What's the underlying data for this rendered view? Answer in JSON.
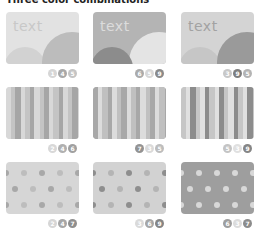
{
  "title": "Three color combinations",
  "cards": [
    {
      "pattern": "circles",
      "text": "text",
      "bg": "#e2e2e2",
      "text_color": "#c8c8c8",
      "circle_big": "#bcbcbc",
      "circle_small": "#d2d2d2",
      "badges": [
        {
          "n": "1",
          "color": "#d6d6d6"
        },
        {
          "n": "4",
          "color": "#a8a8a8"
        },
        {
          "n": "5",
          "color": "#c4c4c4"
        }
      ]
    },
    {
      "pattern": "circles",
      "text": "text",
      "bg": "#b4b4b4",
      "text_color": "#dcdcdc",
      "circle_big": "#e4e4e4",
      "circle_small": "#8c8c8c",
      "badges": [
        {
          "n": "6",
          "color": "#ababab"
        },
        {
          "n": "5",
          "color": "#d8d8d8"
        },
        {
          "n": "9",
          "color": "#8a8a8a"
        }
      ]
    },
    {
      "pattern": "circles",
      "text": "text",
      "bg": "#d4d4d4",
      "text_color": "#a2a2a2",
      "circle_big": "#9a9a9a",
      "circle_small": "#c6c6c6",
      "badges": [
        {
          "n": "3",
          "color": "#c8c8c8"
        },
        {
          "n": "9",
          "color": "#7e7e7e"
        },
        {
          "n": "5",
          "color": "#b4b4b4"
        }
      ]
    },
    {
      "pattern": "stripes",
      "colors": [
        "#d8d8d8",
        "#c4c4c4",
        "#a6a6a6"
      ],
      "badges": [
        {
          "n": "2",
          "color": "#d8d8d8"
        },
        {
          "n": "4",
          "color": "#b0b0b0"
        },
        {
          "n": "6",
          "color": "#a0a0a0"
        }
      ]
    },
    {
      "pattern": "stripes",
      "colors": [
        "#a8a8a8",
        "#dcdcdc",
        "#c0c0c0"
      ],
      "badges": [
        {
          "n": "7",
          "color": "#939393"
        },
        {
          "n": "3",
          "color": "#dadada"
        },
        {
          "n": "5",
          "color": "#bdbdbd"
        }
      ]
    },
    {
      "pattern": "stripes",
      "colors": [
        "#c6c6c6",
        "#e0e0e0",
        "#8c8c8c"
      ],
      "badges": [
        {
          "n": "5",
          "color": "#c4c4c4"
        },
        {
          "n": "3",
          "color": "#e0e0e0"
        },
        {
          "n": "9",
          "color": "#858585"
        }
      ]
    },
    {
      "pattern": "dots",
      "bg": "#d6d6d6",
      "dot_colors": [
        "#a8a8a8",
        "#bdbdbd"
      ],
      "badges": [
        {
          "n": "2",
          "color": "#d6d6d6"
        },
        {
          "n": "4",
          "color": "#a6a6a6"
        },
        {
          "n": "7",
          "color": "#8e8e8e"
        }
      ]
    },
    {
      "pattern": "dots",
      "bg": "#d2d2d2",
      "dot_colors": [
        "#8e8e8e",
        "#b4b4b4"
      ],
      "badges": [
        {
          "n": "3",
          "color": "#dadada"
        },
        {
          "n": "6",
          "color": "#a6a6a6"
        },
        {
          "n": "9",
          "color": "#858585"
        }
      ]
    },
    {
      "pattern": "dots",
      "bg": "#9e9e9e",
      "dot_colors": [
        "#d8d8d8",
        "#d8d8d8"
      ],
      "badges": [
        {
          "n": "6",
          "color": "#9e9e9e"
        },
        {
          "n": "3",
          "color": "#dcdcdc"
        },
        {
          "n": "7",
          "color": "#8c8c8c"
        }
      ]
    }
  ]
}
